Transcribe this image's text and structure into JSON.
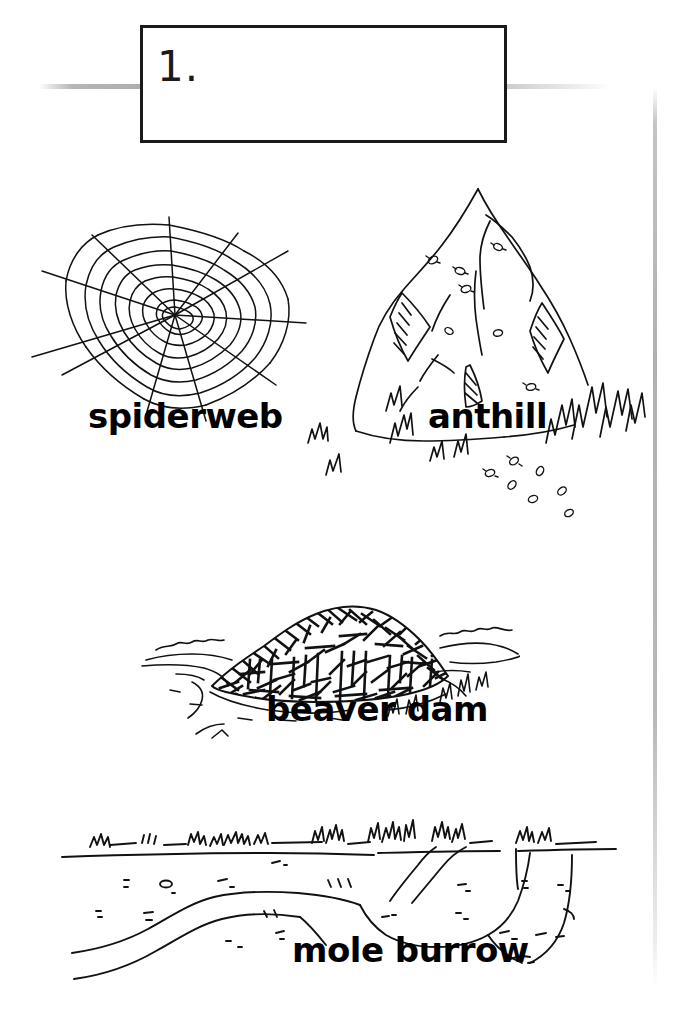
{
  "page": {
    "background_color": "#ffffff",
    "ink_color": "#000000",
    "rule_color": "#a8a8a8"
  },
  "header": {
    "number": "1.",
    "box_border_color": "#1a1a1a"
  },
  "figures": [
    {
      "id": "spiderweb",
      "label": "spiderweb",
      "icon": "spiderweb-icon",
      "description": "radial spider web with spiral threads"
    },
    {
      "id": "anthill",
      "label": "anthill",
      "icon": "anthill-icon",
      "description": "tall conical mound with ants and grass tufts"
    },
    {
      "id": "beaver-dam",
      "label": "beaver dam",
      "icon": "beaver-dam-icon",
      "description": "pile of sticks across a stream"
    },
    {
      "id": "mole-burrow",
      "label": "mole burrow",
      "icon": "mole-burrow-icon",
      "description": "underground cross section of tunnels beneath grass"
    }
  ]
}
